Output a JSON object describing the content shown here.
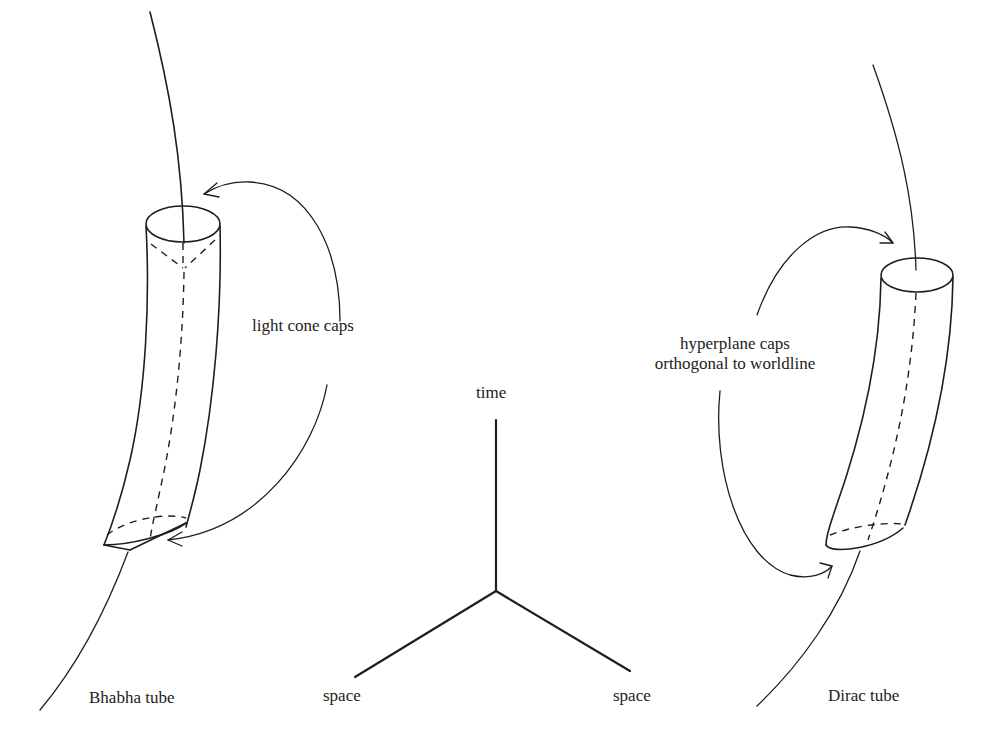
{
  "figure": {
    "axes": {
      "time_label": "time",
      "space_left_label": "space",
      "space_right_label": "space"
    },
    "bhabha": {
      "title": "Bhabha tube",
      "annotation": "light cone caps"
    },
    "dirac": {
      "title": "Dirac tube",
      "annotation_line1": "hyperplane caps",
      "annotation_line2": "orthogonal to worldline"
    },
    "colors": {
      "ink": "#1e1e1e",
      "text": "#222222",
      "background": "#ffffff"
    }
  }
}
